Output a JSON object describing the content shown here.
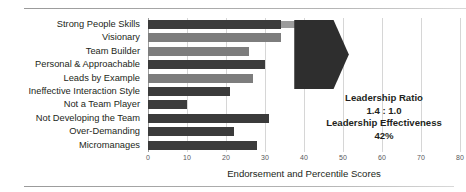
{
  "rules": {
    "top": "divider-top",
    "bottom": "divider-bottom"
  },
  "annotation": {
    "ratio_label": "Leadership Ratio",
    "ratio_value": "1.4 : 1.0",
    "effectiveness_label": "Leadership Effectiveness",
    "effectiveness_value": "42%"
  },
  "colors": {
    "bar_dark": "#3b3b3b",
    "bar_mid": "#7d7d7d",
    "bar_ext": "#9c9c9c",
    "arrow": "#2e2e2e",
    "grid": "#d6d6d6",
    "text": "#231f20"
  },
  "chart_data": {
    "type": "bar",
    "orientation": "horizontal",
    "title": "",
    "xlabel": "Endorsement and Percentile Scores",
    "ylabel": "",
    "xlim": [
      0,
      80
    ],
    "xticks": [
      0,
      10,
      20,
      30,
      40,
      50,
      60,
      70,
      80
    ],
    "xtick_labels": [
      "0",
      "10",
      "20",
      "30",
      "40",
      "50",
      "60",
      "70",
      "80"
    ],
    "grid": true,
    "legend": "none",
    "categories": [
      "Strong People Skills",
      "Visionary",
      "Team Builder",
      "Personal & Approachable",
      "Leads by Example",
      "Ineffective Interaction Style",
      "Not a Team Player",
      "Not Developing the Team",
      "Over-Demanding",
      "Micromanages"
    ],
    "values": [
      34,
      34,
      26,
      30,
      27,
      21,
      10,
      31,
      22,
      28
    ],
    "bar_styles": [
      "dark",
      "mid",
      "mid",
      "dark",
      "mid",
      "dark",
      "dark",
      "dark",
      "dark",
      "dark"
    ],
    "extensions": [
      {
        "index": 0,
        "from": 34,
        "to": 41
      }
    ],
    "annotations": [
      {
        "text": "Leadership Ratio",
        "kind": "label"
      },
      {
        "text": "1.4 : 1.0",
        "kind": "value"
      },
      {
        "text": "Leadership Effectiveness",
        "kind": "label"
      },
      {
        "text": "42%",
        "kind": "value"
      }
    ],
    "overlay": {
      "shape": "chevron-arrow",
      "covers_rows": [
        0,
        1,
        2,
        3,
        4
      ],
      "x_start": 37.5,
      "x_end": 51.5
    }
  }
}
